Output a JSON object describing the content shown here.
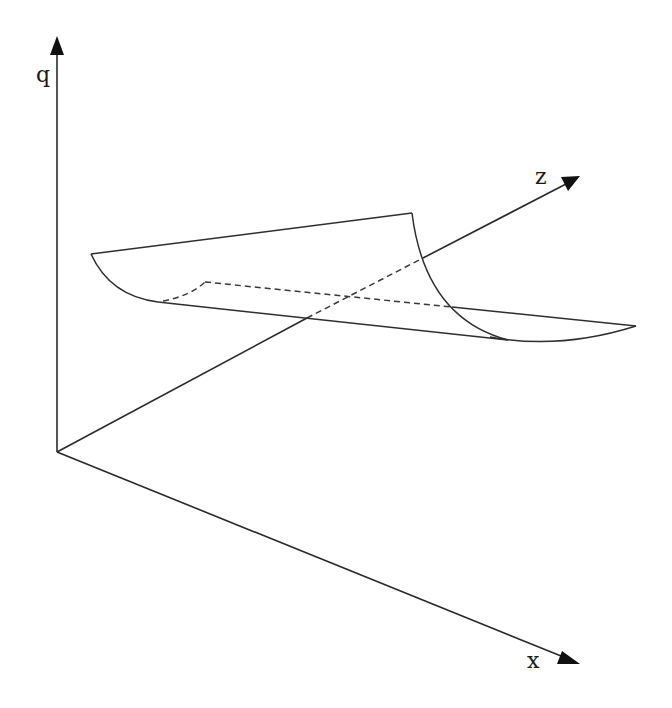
{
  "figure": {
    "type": "3d-axes-surface-sketch",
    "axes": {
      "q": {
        "label": "q",
        "direction": "vertical-up"
      },
      "z": {
        "label": "z",
        "direction": "diagonal-up-right"
      },
      "x": {
        "label": "x",
        "direction": "diagonal-down-right"
      }
    },
    "surface": {
      "description": "curved sheet (half-pipe shaped surface) floating above the x-z plane, with hidden edges drawn dashed",
      "hidden_edges_style": "dashed",
      "visible_edges_style": "solid"
    },
    "colors": {
      "line": "#2f2f2f",
      "arrowhead": "#111111",
      "background": "#ffffff"
    }
  }
}
